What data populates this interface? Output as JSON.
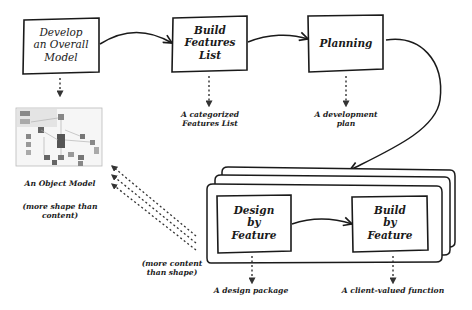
{
  "diagram": {
    "processes": [
      {
        "id": "develop-model",
        "label": "Develop\nan Overall\nModel"
      },
      {
        "id": "build-features-list",
        "label": "Build\nFeatures\nList"
      },
      {
        "id": "planning",
        "label": "Planning"
      },
      {
        "id": "design-by-feature",
        "label": "Design\nby\nFeature"
      },
      {
        "id": "build-by-feature",
        "label": "Build\nby\nFeature"
      }
    ],
    "outputs": [
      {
        "id": "object-model",
        "label": "An Object Model"
      },
      {
        "id": "features-list",
        "label": "A categorized\nFeatures List"
      },
      {
        "id": "development-plan",
        "label": "A development\nplan"
      },
      {
        "id": "design-package",
        "label": "A design package"
      },
      {
        "id": "client-function",
        "label": "A client-valued function"
      }
    ],
    "notes": [
      {
        "id": "shape-note",
        "label": "(more shape than\ncontent)"
      },
      {
        "id": "content-note",
        "label": "(more content\nthan shape)"
      }
    ],
    "edges": [
      {
        "from": "develop-model",
        "to": "build-features-list"
      },
      {
        "from": "build-features-list",
        "to": "planning"
      },
      {
        "from": "planning",
        "to": "iteration-stack"
      },
      {
        "from": "design-by-feature",
        "to": "build-by-feature"
      }
    ],
    "colors": {
      "ink": "#1a1a1a",
      "dots": "#333333",
      "background": "#ffffff"
    }
  }
}
